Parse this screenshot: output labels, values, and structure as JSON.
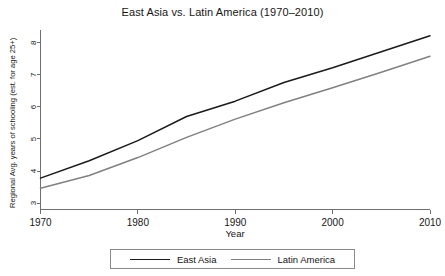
{
  "chart_data": {
    "type": "line",
    "title": "East Asia vs. Latin America (1970–2010)",
    "xlabel": "Year",
    "ylabel": "Regional Avg. years of schooling (est. for age 25+)",
    "x": [
      1970,
      1975,
      1980,
      1985,
      1990,
      1995,
      2000,
      2005,
      2010
    ],
    "xticks": [
      "1970",
      "1980",
      "1990",
      "2000",
      "2010"
    ],
    "xtick_values": [
      1970,
      1980,
      1990,
      2000,
      2010
    ],
    "yticks": [
      "3",
      "4",
      "5",
      "6",
      "7",
      "8"
    ],
    "ytick_values": [
      3,
      4,
      5,
      6,
      7,
      8
    ],
    "xlim": [
      1970,
      2010
    ],
    "ylim": [
      2.8,
      8.4
    ],
    "grid": false,
    "legend_position": "below",
    "series": [
      {
        "name": "East Asia",
        "color": "#1a1a1a",
        "values": [
          3.78,
          4.32,
          4.95,
          5.7,
          6.18,
          6.76,
          7.22,
          7.72,
          8.22
        ]
      },
      {
        "name": "Latin America",
        "color": "#808080",
        "values": [
          3.46,
          3.86,
          4.42,
          5.05,
          5.62,
          6.13,
          6.6,
          7.08,
          7.58
        ]
      }
    ]
  },
  "legend": {
    "items": [
      {
        "label": "East Asia",
        "color": "#1a1a1a"
      },
      {
        "label": "Latin America",
        "color": "#808080"
      }
    ]
  }
}
